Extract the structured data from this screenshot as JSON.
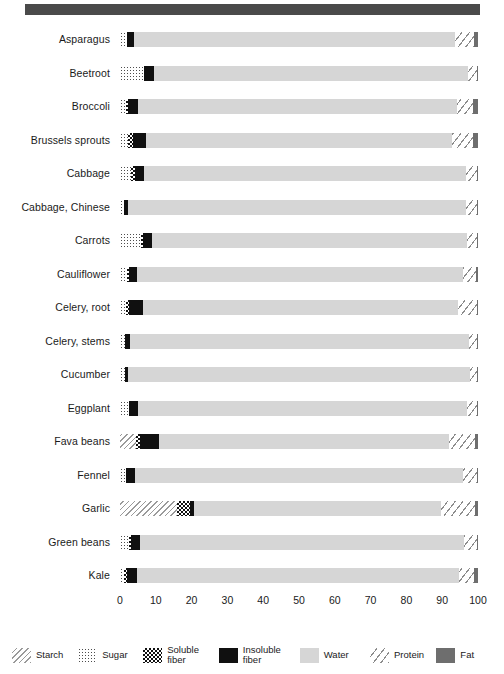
{
  "chart_data": {
    "type": "bar",
    "orientation": "horizontal",
    "stacked": true,
    "title": "",
    "subtitle": "",
    "xlabel": "",
    "ylabel": "",
    "xlim": [
      0,
      100
    ],
    "xticks": [
      0,
      10,
      20,
      30,
      40,
      50,
      60,
      70,
      80,
      90,
      100
    ],
    "xtick_labels": [
      "0",
      "10",
      "20",
      "30",
      "40",
      "50",
      "60",
      "70",
      "80",
      "90",
      "100"
    ],
    "grid": false,
    "legend_position": "bottom",
    "units": "percent of edible portion by weight",
    "series": [
      {
        "name": "Starch",
        "key": "starch",
        "fill": "f-starch",
        "color": "#9a9a9a"
      },
      {
        "name": "Sugar",
        "key": "sugar",
        "fill": "f-sugar",
        "color": "#4d4d4d"
      },
      {
        "name": "Soluble\nfiber",
        "key": "soluble",
        "fill": "f-solfiber",
        "color": "#111111"
      },
      {
        "name": "Insoluble\nfiber",
        "key": "insoluble",
        "fill": "f-insfiber",
        "color": "#101010"
      },
      {
        "name": "Water",
        "key": "water",
        "fill": "f-water",
        "color": "#d6d6d6"
      },
      {
        "name": "Protein",
        "key": "protein",
        "fill": "f-protein",
        "color": "#8c8c8c"
      },
      {
        "name": "Fat",
        "key": "fat",
        "fill": "f-fat",
        "color": "#6e6e6e"
      }
    ],
    "categories": [
      "Asparagus",
      "Beetroot",
      "Broccoli",
      "Brussels sprouts",
      "Cabbage",
      "Cabbage, Chinese",
      "Carrots",
      "Cauliflower",
      "Celery, root",
      "Celery, stems",
      "Cucumber",
      "Eggplant",
      "Fava beans",
      "Fennel",
      "Garlic",
      "Green beans",
      "Kale"
    ],
    "rows": [
      {
        "category": "Asparagus",
        "starch": 0.0,
        "sugar": 1.9,
        "soluble": 0.0,
        "insoluble": 2.1,
        "water": 89.5,
        "protein": 5.3,
        "fat": 1.2
      },
      {
        "category": "Beetroot",
        "starch": 0.0,
        "sugar": 6.8,
        "soluble": 0.0,
        "insoluble": 2.8,
        "water": 87.6,
        "protein": 2.6,
        "fat": 0.2
      },
      {
        "category": "Broccoli",
        "starch": 0.0,
        "sugar": 1.7,
        "soluble": 0.6,
        "insoluble": 2.6,
        "water": 89.3,
        "protein": 4.4,
        "fat": 1.4
      },
      {
        "category": "Brussels sprouts",
        "starch": 0.0,
        "sugar": 2.2,
        "soluble": 1.4,
        "insoluble": 3.8,
        "water": 85.2,
        "protein": 6.0,
        "fat": 1.4
      },
      {
        "category": "Cabbage",
        "starch": 0.0,
        "sugar": 3.2,
        "soluble": 1.0,
        "insoluble": 2.5,
        "water": 90.0,
        "protein": 3.0,
        "fat": 0.3
      },
      {
        "category": "Cabbage, Chinese",
        "starch": 0.0,
        "sugar": 1.2,
        "soluble": 0.0,
        "insoluble": 1.0,
        "water": 94.5,
        "protein": 3.0,
        "fat": 0.3
      },
      {
        "category": "Carrots",
        "starch": 0.0,
        "sugar": 5.9,
        "soluble": 0.5,
        "insoluble": 2.5,
        "water": 88.0,
        "protein": 2.8,
        "fat": 0.3
      },
      {
        "category": "Cauliflower",
        "starch": 0.0,
        "sugar": 1.9,
        "soluble": 0.5,
        "insoluble": 2.4,
        "water": 91.0,
        "protein": 3.7,
        "fat": 0.5
      },
      {
        "category": "Celery, root",
        "starch": 0.0,
        "sugar": 1.6,
        "soluble": 1.0,
        "insoluble": 3.9,
        "water": 88.0,
        "protein": 5.2,
        "fat": 0.3
      },
      {
        "category": "Celery, stems",
        "starch": 0.0,
        "sugar": 1.3,
        "soluble": 0.0,
        "insoluble": 1.6,
        "water": 94.5,
        "protein": 2.3,
        "fat": 0.3
      },
      {
        "category": "Cucumber",
        "starch": 0.0,
        "sugar": 1.5,
        "soluble": 0.0,
        "insoluble": 0.7,
        "water": 95.5,
        "protein": 2.0,
        "fat": 0.3
      },
      {
        "category": "Eggplant",
        "starch": 0.0,
        "sugar": 2.4,
        "soluble": 0.0,
        "insoluble": 2.6,
        "water": 92.0,
        "protein": 2.7,
        "fat": 0.3
      },
      {
        "category": "Fava beans",
        "starch": 4.4,
        "sugar": 0.0,
        "soluble": 1.1,
        "insoluble": 5.5,
        "water": 81.0,
        "protein": 7.2,
        "fat": 0.8
      },
      {
        "category": "Fennel",
        "starch": 0.0,
        "sugar": 1.6,
        "soluble": 0.0,
        "insoluble": 2.7,
        "water": 91.5,
        "protein": 3.9,
        "fat": 0.3
      },
      {
        "category": "Garlic",
        "starch": 16.0,
        "sugar": 0.0,
        "soluble": 3.6,
        "insoluble": 1.0,
        "water": 69.0,
        "protein": 9.6,
        "fat": 0.8
      },
      {
        "category": "Green beans",
        "starch": 0.0,
        "sugar": 2.4,
        "soluble": 0.6,
        "insoluble": 2.7,
        "water": 90.5,
        "protein": 3.5,
        "fat": 0.3
      },
      {
        "category": "Kale",
        "starch": 0.0,
        "sugar": 1.1,
        "soluble": 0.8,
        "insoluble": 2.9,
        "water": 90.0,
        "protein": 4.0,
        "fat": 1.2
      }
    ]
  },
  "legend": {
    "items": [
      {
        "label": "Starch",
        "fill": "f-starch"
      },
      {
        "label": "Sugar",
        "fill": "f-sugar"
      },
      {
        "label": "Soluble\nfiber",
        "fill": "f-solfiber"
      },
      {
        "label": "Insoluble\nfiber",
        "fill": "f-insfiber"
      },
      {
        "label": "Water",
        "fill": "f-water"
      },
      {
        "label": "Protein",
        "fill": "f-protein"
      },
      {
        "label": "Fat",
        "fill": "f-fat"
      }
    ]
  },
  "header_band": {
    "color": "#4a4a4a"
  }
}
